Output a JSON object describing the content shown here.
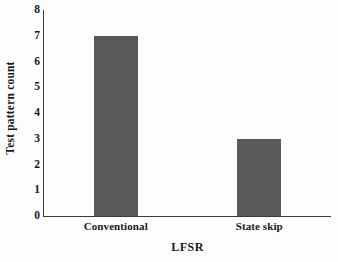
{
  "chart_data": {
    "type": "bar",
    "title": "",
    "categories": [
      "Conventional",
      "State skip"
    ],
    "values": [
      7,
      3
    ],
    "xlabel": "LFSR",
    "ylabel": "Test pattern count",
    "ylim": [
      0,
      8
    ],
    "yticks": [
      0,
      1,
      2,
      3,
      4,
      5,
      6,
      7,
      8
    ],
    "ytick_labels": [
      "0",
      "1",
      "2",
      "3",
      "4",
      "5",
      "6",
      "7",
      "8"
    ],
    "grid": false,
    "legend": false,
    "series": [
      {
        "name": "Test pattern count",
        "values": [
          7,
          3
        ],
        "color": "#595959"
      }
    ],
    "bar_color": "#595959",
    "axis_color": "#3a3a3a",
    "background_color": "#fdfdfd"
  }
}
